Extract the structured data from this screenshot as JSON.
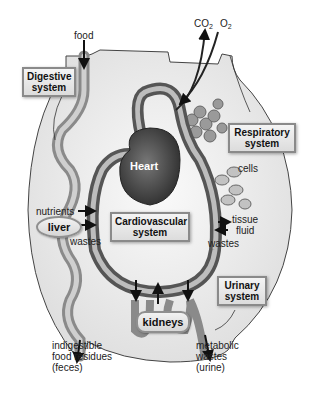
{
  "diagram": {
    "type": "organ-system-interaction",
    "systems": {
      "digestive": "Digestive\nsystem",
      "respiratory": "Respiratory\nsystem",
      "cardiovascular": "Cardiovascular\nsystem",
      "urinary": "Urinary\nsystem"
    },
    "organs": {
      "heart": "Heart",
      "liver": "liver",
      "kidneys": "kidneys"
    },
    "labels": {
      "food": "food",
      "co2_base": "CO",
      "co2_sub": "2",
      "o2_base": "O",
      "o2_sub": "2",
      "nutrients": "nutrients",
      "wastes_left": "wastes",
      "cells": "cells",
      "tissue_fluid_1": "tissue",
      "tissue_fluid_2": "fluid",
      "wastes_right": "wastes",
      "feces_1": "indigestible",
      "feces_2": "food residues",
      "feces_3": "(feces)",
      "urine_1": "metabolic",
      "urine_2": "wastes",
      "urine_3": "(urine)"
    },
    "colors": {
      "vessel": "#6e6e6e",
      "vessel_inner": "#c8c8c8",
      "heart": "#555555",
      "body_fill": "#eeeeee",
      "outline": "#444444"
    }
  }
}
